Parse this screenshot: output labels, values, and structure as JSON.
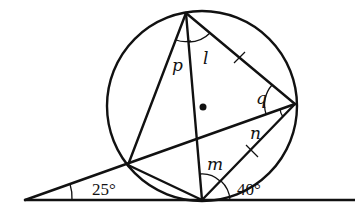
{
  "figure": {
    "labels": {
      "p": "p",
      "l": "l",
      "q": "q",
      "n": "n",
      "m": "m",
      "angle_25": "25°",
      "angle_40": "40°"
    },
    "colors": {
      "stroke": "#111111",
      "background": "#ffffff"
    }
  }
}
